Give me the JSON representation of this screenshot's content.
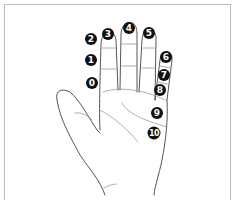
{
  "diagram": {
    "colors": {
      "outline": "#555555",
      "crease": "#9a9a9a",
      "marker": "#111111",
      "marker_text": "#ffffff",
      "frame": "#bdbdbd"
    },
    "markers": [
      {
        "label": "0",
        "x": 92,
        "y": 83
      },
      {
        "label": "1",
        "x": 91,
        "y": 60
      },
      {
        "label": "2",
        "x": 91,
        "y": 39
      },
      {
        "label": "3",
        "x": 108,
        "y": 34
      },
      {
        "label": "4",
        "x": 129,
        "y": 28
      },
      {
        "label": "5",
        "x": 149,
        "y": 33
      },
      {
        "label": "6",
        "x": 166,
        "y": 57
      },
      {
        "label": "7",
        "x": 164,
        "y": 75
      },
      {
        "label": "8",
        "x": 160,
        "y": 90
      },
      {
        "label": "9",
        "x": 157,
        "y": 113
      },
      {
        "label": "10",
        "x": 154,
        "y": 133
      }
    ]
  }
}
